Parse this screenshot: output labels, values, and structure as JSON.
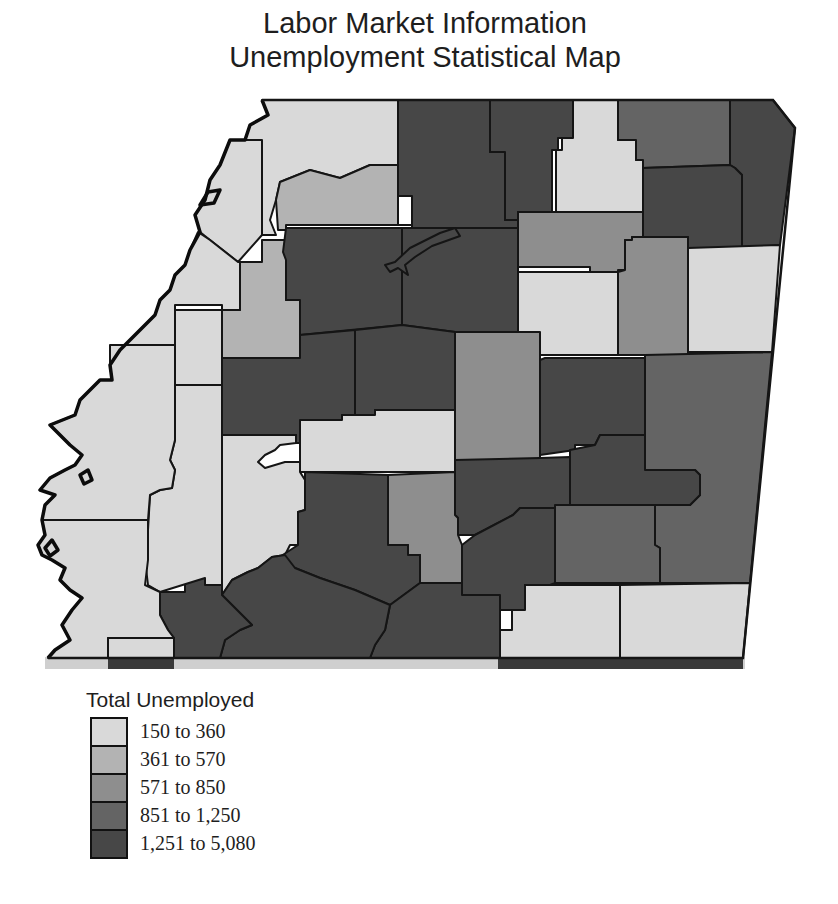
{
  "title": {
    "line1": "Labor Market Information",
    "line2": "Unemployment Statistical Map"
  },
  "legend": {
    "title": "Total Unemployed",
    "items": [
      {
        "label": "150 to 360",
        "color": "#d9d9d9"
      },
      {
        "label": "361 to 570",
        "color": "#b3b3b3"
      },
      {
        "label": "571 to 850",
        "color": "#8e8e8e"
      },
      {
        "label": "851 to 1,250",
        "color": "#646464"
      },
      {
        "label": "1,251 to 5,080",
        "color": "#474747"
      }
    ]
  },
  "map": {
    "type": "choropleth",
    "variable": "Total Unemployed",
    "classes": 5,
    "border_color": "#151515"
  }
}
